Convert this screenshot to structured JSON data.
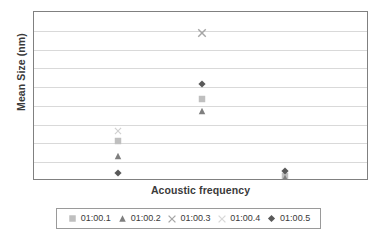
{
  "chart_data": {
    "type": "scatter",
    "title": "",
    "xlabel": "Acoustic frequency",
    "ylabel": "Mean Size (nm)",
    "grid": true,
    "grid_lines": 8,
    "legend_position": "bottom",
    "xlim": [
      0,
      4
    ],
    "ylim": [
      0,
      800
    ],
    "x_tick_labels": [],
    "y_tick_labels": [],
    "categories": [
      "1",
      "2",
      "3"
    ],
    "series": [
      {
        "name": "01:00.1",
        "marker": "square",
        "color": "#bfbfbf",
        "x": [
          1,
          2,
          3
        ],
        "values": [
          190,
          390,
          25
        ]
      },
      {
        "name": "01:00.2",
        "marker": "triangle",
        "color": "#7f7f7f",
        "x": [
          1,
          2,
          3
        ],
        "values": [
          120,
          330,
          15
        ]
      },
      {
        "name": "01:00.3",
        "marker": "cross",
        "color": "#a6a6a6",
        "x": [
          2
        ],
        "values": [
          700
        ]
      },
      {
        "name": "01:00.4",
        "marker": "cross-light",
        "color": "#d0d0d0",
        "x": [
          1
        ],
        "values": [
          235
        ]
      },
      {
        "name": "01:00.5",
        "marker": "diamond",
        "color": "#595959",
        "x": [
          1,
          2,
          3
        ],
        "values": [
          40,
          460,
          45
        ]
      }
    ]
  },
  "axes": {
    "y_title": "Mean Size (nm)",
    "x_title": "Acoustic frequency"
  },
  "legend": {
    "items": [
      {
        "label": "01:00.1",
        "marker": "square",
        "color": "#bfbfbf"
      },
      {
        "label": "01:00.2",
        "marker": "triangle",
        "color": "#7f7f7f"
      },
      {
        "label": "01:00.3",
        "marker": "cross",
        "color": "#a6a6a6"
      },
      {
        "label": "01:00.4",
        "marker": "cross-light",
        "color": "#d8d8d8"
      },
      {
        "label": "01:00.5",
        "marker": "diamond",
        "color": "#595959"
      }
    ]
  },
  "colors": {
    "plot_border": "#808080",
    "gridline": "#d9d9d9",
    "text": "#3a3a3a",
    "background": "#ffffff"
  }
}
